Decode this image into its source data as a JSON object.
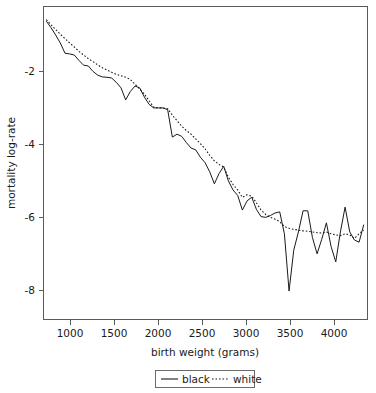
{
  "chart_data": {
    "type": "line",
    "title": "",
    "subtitle": "",
    "xlabel": "birth weight (grams)",
    "ylabel": "mortality log-rate",
    "xlim": [
      820,
      4290
    ],
    "ylim": [
      -8.8,
      -0.22
    ],
    "xticks": [
      1000,
      1500,
      2000,
      2500,
      3000,
      3500,
      4000
    ],
    "xticklabels": [
      "1000",
      "1500",
      "2000",
      "2500",
      "3000",
      "3500",
      "4000"
    ],
    "yticks": [
      -2,
      -4,
      -6,
      -8
    ],
    "yticklabels": [
      "-2",
      "-4",
      "-6",
      "-8"
    ],
    "grid": false,
    "legend": {
      "position": "bottom-outside",
      "entries": [
        {
          "label": "black",
          "style": "solid"
        },
        {
          "label": "white",
          "style": "dotted"
        }
      ]
    },
    "series": [
      {
        "name": "black",
        "style": "solid",
        "x": [
          850,
          900,
          950,
          1000,
          1050,
          1100,
          1150,
          1200,
          1250,
          1300,
          1350,
          1400,
          1450,
          1500,
          1550,
          1600,
          1650,
          1700,
          1750,
          1800,
          1850,
          1900,
          1950,
          2000,
          2050,
          2100,
          2150,
          2200,
          2250,
          2300,
          2350,
          2400,
          2450,
          2500,
          2550,
          2600,
          2650,
          2700,
          2750,
          2800,
          2850,
          2900,
          2950,
          3000,
          3050,
          3100,
          3150,
          3200,
          3250,
          3300,
          3350,
          3400,
          3450,
          3500,
          3550,
          3600,
          3650,
          3700,
          3750,
          3800,
          3850,
          3900,
          3950,
          4000,
          4050,
          4100,
          4150,
          4200,
          4250
        ],
        "y": [
          -0.62,
          -0.8,
          -1.0,
          -1.22,
          -1.5,
          -1.52,
          -1.55,
          -1.7,
          -1.83,
          -1.85,
          -2.0,
          -2.1,
          -2.15,
          -2.16,
          -2.18,
          -2.3,
          -2.45,
          -2.78,
          -2.55,
          -2.4,
          -2.45,
          -2.7,
          -2.9,
          -3.0,
          -3.0,
          -3.0,
          -3.05,
          -3.8,
          -3.72,
          -3.78,
          -3.95,
          -4.1,
          -4.15,
          -4.35,
          -4.5,
          -4.75,
          -5.08,
          -4.8,
          -4.6,
          -5.0,
          -5.25,
          -5.4,
          -5.8,
          -5.55,
          -5.45,
          -5.78,
          -5.98,
          -6.0,
          -5.95,
          -5.88,
          -5.85,
          -6.45,
          -8.02,
          -6.9,
          -6.4,
          -5.82,
          -5.82,
          -6.55,
          -7.0,
          -6.6,
          -6.15,
          -6.8,
          -7.22,
          -6.4,
          -5.72,
          -6.4,
          -6.62,
          -6.68,
          -6.2
        ]
      },
      {
        "name": "white",
        "style": "dotted",
        "x": [
          850,
          900,
          950,
          1000,
          1050,
          1100,
          1150,
          1200,
          1250,
          1300,
          1350,
          1400,
          1450,
          1500,
          1550,
          1600,
          1650,
          1700,
          1750,
          1800,
          1850,
          1900,
          1950,
          2000,
          2050,
          2100,
          2150,
          2200,
          2250,
          2300,
          2350,
          2400,
          2450,
          2500,
          2550,
          2600,
          2650,
          2700,
          2750,
          2800,
          2850,
          2900,
          2950,
          3000,
          3050,
          3100,
          3150,
          3200,
          3250,
          3300,
          3350,
          3400,
          3450,
          3500,
          3550,
          3600,
          3650,
          3700,
          3750,
          3800,
          3850,
          3900,
          3950,
          4000,
          4050,
          4100,
          4150,
          4200,
          4250
        ],
        "y": [
          -0.58,
          -0.72,
          -0.85,
          -0.98,
          -1.1,
          -1.22,
          -1.33,
          -1.45,
          -1.55,
          -1.65,
          -1.73,
          -1.82,
          -1.9,
          -1.96,
          -2.02,
          -2.08,
          -2.12,
          -2.16,
          -2.22,
          -2.35,
          -2.48,
          -2.62,
          -2.8,
          -2.98,
          -3.0,
          -3.0,
          -3.02,
          -3.2,
          -3.35,
          -3.5,
          -3.62,
          -3.72,
          -3.85,
          -3.98,
          -4.12,
          -4.3,
          -4.45,
          -4.55,
          -4.62,
          -4.9,
          -5.1,
          -5.25,
          -5.45,
          -5.38,
          -5.42,
          -5.6,
          -5.8,
          -5.92,
          -6.0,
          -6.05,
          -6.12,
          -6.25,
          -6.3,
          -6.33,
          -6.35,
          -6.37,
          -6.38,
          -6.4,
          -6.42,
          -6.43,
          -6.4,
          -6.45,
          -6.48,
          -6.5,
          -6.45,
          -6.48,
          -6.58,
          -6.45,
          -6.35
        ]
      }
    ]
  },
  "axes": {
    "x_tick_labels": [
      "1000",
      "1500",
      "2000",
      "2500",
      "3000",
      "3500",
      "4000"
    ],
    "y_tick_labels": [
      "-2",
      "-4",
      "-6",
      "-8"
    ],
    "x_title": "birth weight (grams)",
    "y_title": "mortality log-rate"
  },
  "legend": {
    "black_label": "black",
    "white_label": "white"
  }
}
